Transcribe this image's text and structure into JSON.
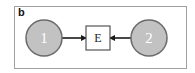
{
  "panel": {
    "label": "b"
  },
  "nodes": [
    {
      "id": "1",
      "label": "1",
      "shape": "circle",
      "fill": "#c2c2c2",
      "stroke": "#6b6b6b",
      "text_color": "#ffffff"
    },
    {
      "id": "E",
      "label": "E",
      "shape": "square",
      "fill": "#ffffff",
      "stroke": "#555555",
      "text_color": "#222222"
    },
    {
      "id": "2",
      "label": "2",
      "shape": "circle",
      "fill": "#c2c2c2",
      "stroke": "#6b6b6b",
      "text_color": "#ffffff"
    }
  ],
  "edges": [
    {
      "from": "1",
      "to": "E",
      "arrow": "arrow-right-icon"
    },
    {
      "from": "2",
      "to": "E",
      "arrow": "arrow-left-icon"
    }
  ],
  "colors": {
    "frame_border": "#a0a0a0",
    "edge": "#1a1a1a"
  }
}
